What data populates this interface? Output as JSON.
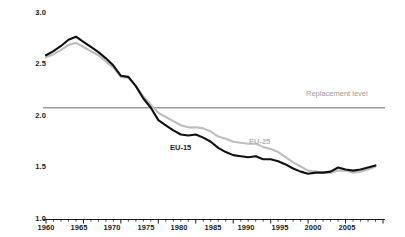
{
  "chart_data": {
    "type": "line",
    "title": "",
    "subtitle": "",
    "xlabel": "",
    "ylabel": "",
    "xlim": [
      1960,
      2005
    ],
    "ylim": [
      1.0,
      3.0
    ],
    "grid": false,
    "legend_position": "inline",
    "y_ticks": [
      "3.0",
      "2.5",
      "2.0",
      "1.5",
      "1.0"
    ],
    "y_tick_values": [
      3.0,
      2.5,
      2.0,
      1.5,
      1.0
    ],
    "x_ticks": [
      "1960",
      "1965",
      "1970",
      "1975",
      "1980",
      "1985",
      "1990",
      "1995",
      "2000",
      "2005"
    ],
    "x_tick_values": [
      1960,
      1965,
      1970,
      1975,
      1980,
      1985,
      1990,
      1995,
      2000,
      2005
    ],
    "annotations": [
      {
        "name": "replacement-level",
        "text": "Replacement level",
        "value": 2.08,
        "color": "#9a9a9a"
      }
    ],
    "series": [
      {
        "name": "EU-15",
        "label": "EU-15",
        "color": "#111111",
        "x": [
          1960,
          1961,
          1962,
          1963,
          1964,
          1965,
          1966,
          1967,
          1968,
          1969,
          1970,
          1971,
          1972,
          1973,
          1974,
          1975,
          1976,
          1977,
          1978,
          1979,
          1980,
          1981,
          1982,
          1983,
          1984,
          1985,
          1986,
          1987,
          1988,
          1989,
          1990,
          1991,
          1992,
          1993,
          1994,
          1995,
          1996,
          1997,
          1998,
          1999,
          2000,
          2001,
          2002,
          2003,
          2004
        ],
        "values": [
          2.59,
          2.63,
          2.68,
          2.74,
          2.77,
          2.72,
          2.67,
          2.62,
          2.56,
          2.49,
          2.39,
          2.38,
          2.29,
          2.17,
          2.08,
          1.96,
          1.91,
          1.86,
          1.82,
          1.81,
          1.82,
          1.79,
          1.75,
          1.69,
          1.65,
          1.62,
          1.61,
          1.6,
          1.61,
          1.58,
          1.58,
          1.56,
          1.53,
          1.49,
          1.46,
          1.44,
          1.45,
          1.45,
          1.46,
          1.5,
          1.48,
          1.47,
          1.48,
          1.5,
          1.52
        ]
      },
      {
        "name": "EU-25",
        "label": "EU-25",
        "color": "#bdbdbd",
        "x": [
          1960,
          1961,
          1962,
          1963,
          1964,
          1965,
          1966,
          1967,
          1968,
          1969,
          1970,
          1971,
          1972,
          1973,
          1974,
          1975,
          1976,
          1977,
          1978,
          1979,
          1980,
          1981,
          1982,
          1983,
          1984,
          1985,
          1986,
          1987,
          1988,
          1989,
          1990,
          1991,
          1992,
          1993,
          1994,
          1995,
          1996,
          1997,
          1998,
          1999,
          2000,
          2001,
          2002,
          2003,
          2004
        ],
        "values": [
          2.57,
          2.6,
          2.64,
          2.69,
          2.71,
          2.67,
          2.63,
          2.59,
          2.53,
          2.47,
          2.38,
          2.37,
          2.29,
          2.19,
          2.11,
          2.03,
          1.99,
          1.95,
          1.91,
          1.89,
          1.89,
          1.88,
          1.85,
          1.8,
          1.78,
          1.75,
          1.74,
          1.73,
          1.73,
          1.7,
          1.68,
          1.65,
          1.6,
          1.55,
          1.51,
          1.47,
          1.46,
          1.45,
          1.45,
          1.47,
          1.47,
          1.45,
          1.46,
          1.48,
          1.51
        ]
      }
    ]
  },
  "labels": {
    "series_eu15": "EU-15",
    "series_eu25": "EU-25",
    "replacement_level": "Replacement level"
  },
  "colors": {
    "eu15": "#111111",
    "eu25": "#bdbdbd",
    "replacement": "#9a9a9a",
    "axis": "#1a1a1a",
    "background": "#ffffff"
  }
}
